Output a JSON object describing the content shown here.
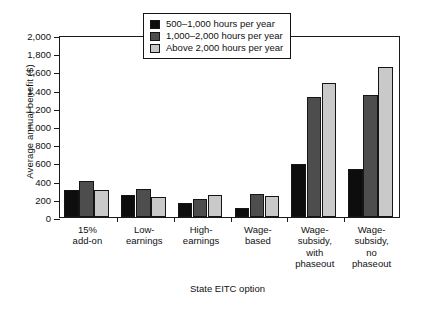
{
  "chart_data": {
    "type": "bar",
    "title": "",
    "xlabel": "State EITC option",
    "ylabel": "Average annual benefit ($)",
    "ylim": [
      0,
      2000
    ],
    "ytick_values": [
      0,
      200,
      400,
      600,
      800,
      1000,
      1200,
      1400,
      1600,
      1800,
      2000
    ],
    "ytick_labels": [
      "0",
      "200",
      "400",
      "600",
      "800",
      "1,000",
      "1,200",
      "1,400",
      "1,600",
      "1,800",
      "2,000"
    ],
    "grid": false,
    "legend_position": "top-center",
    "categories": [
      "15%\nadd-on",
      "Low-\nearnings",
      "High-\nearnings",
      "Wage-\nbased",
      "Wage-\nsubsidy,\nwith\nphaseout",
      "Wage-\nsubsidy,\nno\nphaseout"
    ],
    "series": [
      {
        "name": "500–1,000 hours per year",
        "color": "#0d0d0d",
        "values": [
          300,
          245,
          155,
          100,
          580,
          530
        ]
      },
      {
        "name": "1,000–2,000 hours per year",
        "color": "#4d4d4d",
        "values": [
          400,
          310,
          195,
          255,
          1320,
          1340
        ]
      },
      {
        "name": "Above 2,000 hours per year",
        "color": "#c9c9c9",
        "values": [
          300,
          225,
          240,
          235,
          1470,
          1650
        ]
      }
    ]
  }
}
